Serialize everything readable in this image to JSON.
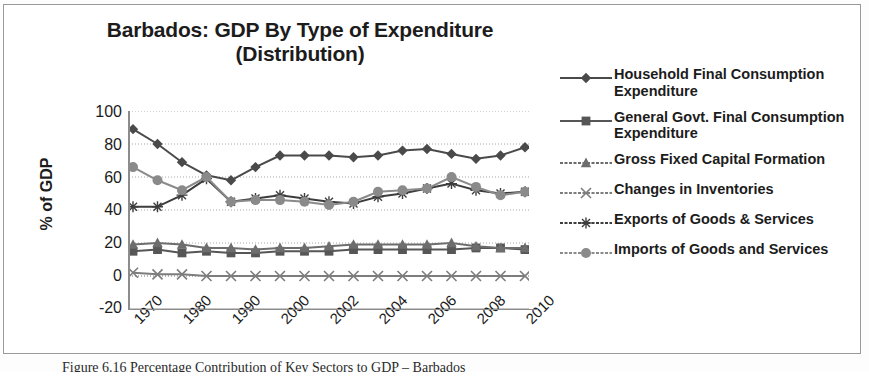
{
  "figure": {
    "title_line1": "Barbados: GDP By Type of Expenditure",
    "title_line2": "(Distribution)",
    "caption": "Figure 6.16 Percentage Contribution of Key Sectors to GDP – Barbados",
    "border_color": "#9a9a9a",
    "background": "#ffffff"
  },
  "chart_data": {
    "type": "line",
    "title": "Barbados: GDP By Type of Expenditure (Distribution)",
    "subtitle": "(Distribution)",
    "xlabel": "",
    "ylabel": "% of GDP",
    "ylim": [
      -20,
      100
    ],
    "yticks": [
      100,
      80,
      60,
      40,
      20,
      0,
      -20
    ],
    "grid": true,
    "grid_axis": "y",
    "legend_position": "right",
    "x": [
      "1970",
      "1975",
      "1980",
      "1985",
      "1990",
      "1995",
      "2000",
      "2001",
      "2002",
      "2003",
      "2004",
      "2005",
      "2006",
      "2007",
      "2008",
      "2009",
      "2010"
    ],
    "xtick_labels": [
      "1970",
      "1980",
      "1990",
      "2000",
      "2002",
      "2004",
      "2006",
      "2008",
      "2010"
    ],
    "series": [
      {
        "name": "Household Final Consumption Expenditure",
        "marker": "diamond",
        "color": "#4a4a4a",
        "values": [
          89,
          80,
          69,
          61,
          58,
          66,
          73,
          73,
          73,
          72,
          73,
          76,
          77,
          74,
          71,
          73,
          78
        ]
      },
      {
        "name": "General Govt. Final Consumption Expenditure",
        "marker": "square",
        "color": "#565656",
        "values": [
          15,
          16,
          14,
          15,
          14,
          14,
          15,
          15,
          15,
          16,
          16,
          16,
          16,
          16,
          17,
          17,
          16
        ]
      },
      {
        "name": "Gross Fixed Capital Formation",
        "marker": "triangle",
        "color": "#6d6d6d",
        "values": [
          19,
          20,
          19,
          17,
          17,
          16,
          17,
          17,
          18,
          19,
          19,
          19,
          19,
          20,
          18,
          17,
          17
        ]
      },
      {
        "name": "Changes in Inventories",
        "marker": "cross",
        "color": "#7d7d7d",
        "values": [
          2,
          1,
          1,
          0,
          0,
          0,
          0,
          0,
          0,
          0,
          0,
          0,
          0,
          0,
          0,
          0,
          0
        ]
      },
      {
        "name": "Exports of Goods & Services",
        "marker": "star",
        "color": "#3d3d3d",
        "values": [
          42,
          42,
          49,
          59,
          45,
          47,
          49,
          47,
          45,
          44,
          48,
          50,
          53,
          56,
          52,
          50,
          51
        ]
      },
      {
        "name": "Imports of Goods and Services",
        "marker": "circle",
        "color": "#8a8a8a",
        "values": [
          66,
          58,
          52,
          60,
          45,
          46,
          46,
          45,
          43,
          45,
          51,
          52,
          53,
          60,
          54,
          49,
          51
        ]
      }
    ]
  },
  "yaxis": {
    "title": "% of GDP",
    "ticks": [
      "100",
      "80",
      "60",
      "40",
      "20",
      "0",
      "-20"
    ]
  },
  "xaxis": {
    "ticks": [
      "1970",
      "1980",
      "1990",
      "2000",
      "2002",
      "2004",
      "2006",
      "2008",
      "2010"
    ]
  },
  "legend": {
    "items": [
      {
        "label": "Household Final Consumption Expenditure",
        "marker": "diamond-marker-icon",
        "color": "#4a4a4a"
      },
      {
        "label": "General Govt. Final Consumption Expenditure",
        "marker": "square-marker-icon",
        "color": "#565656"
      },
      {
        "label": "Gross Fixed Capital Formation",
        "marker": "triangle-marker-icon",
        "color": "#6d6d6d"
      },
      {
        "label": "Changes in Inventories",
        "marker": "cross-marker-icon",
        "color": "#7d7d7d"
      },
      {
        "label": "Exports of Goods & Services",
        "marker": "star-marker-icon",
        "color": "#3d3d3d"
      },
      {
        "label": "Imports of Goods and Services",
        "marker": "circle-marker-icon",
        "color": "#8a8a8a"
      }
    ]
  }
}
